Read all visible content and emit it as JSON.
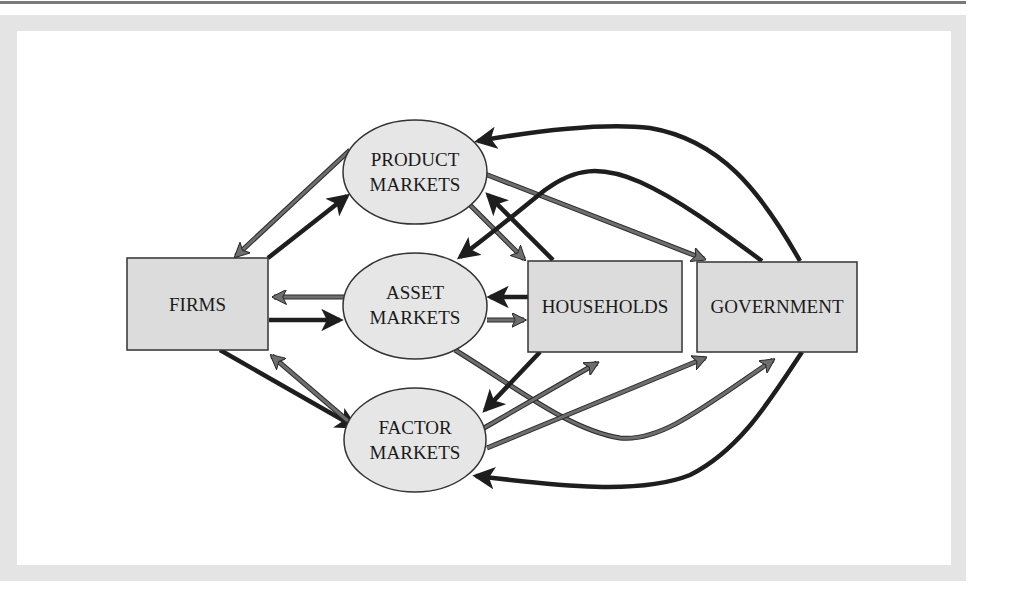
{
  "diagram": {
    "type": "circular-flow",
    "colors": {
      "box_fill": "#dcdcdc",
      "ellipse_fill": "#e6e6e6",
      "outline": "#333333",
      "dark_arrow": "#1e1e1e",
      "grey_arrow": "#6e6e6e",
      "frame": "#e4e4e4"
    },
    "nodes": {
      "firms": {
        "label": "FIRMS",
        "shape": "rectangle"
      },
      "households": {
        "label": "HOUSEHOLDS",
        "shape": "rectangle"
      },
      "government": {
        "label": "GOVERNMENT",
        "shape": "rectangle"
      },
      "product_markets": {
        "line1": "PRODUCT",
        "line2": "MARKETS",
        "shape": "ellipse"
      },
      "asset_markets": {
        "line1": "ASSET",
        "line2": "MARKETS",
        "shape": "ellipse"
      },
      "factor_markets": {
        "line1": "FACTOR",
        "line2": "MARKETS",
        "shape": "ellipse"
      }
    },
    "edges": [
      {
        "from": "product_markets",
        "to": "firms",
        "style": "grey"
      },
      {
        "from": "firms",
        "to": "product_markets",
        "style": "dark"
      },
      {
        "from": "asset_markets",
        "to": "firms",
        "style": "grey"
      },
      {
        "from": "firms",
        "to": "asset_markets",
        "style": "dark"
      },
      {
        "from": "firms",
        "to": "factor_markets",
        "style": "dark"
      },
      {
        "from": "factor_markets",
        "to": "firms",
        "style": "grey"
      },
      {
        "from": "product_markets",
        "to": "households",
        "style": "grey"
      },
      {
        "from": "households",
        "to": "product_markets",
        "style": "dark"
      },
      {
        "from": "product_markets",
        "to": "government",
        "style": "grey"
      },
      {
        "from": "government",
        "to": "product_markets",
        "style": "dark"
      },
      {
        "from": "government",
        "to": "asset_markets",
        "style": "dark"
      },
      {
        "from": "households",
        "to": "asset_markets",
        "style": "dark"
      },
      {
        "from": "asset_markets",
        "to": "households",
        "style": "grey"
      },
      {
        "from": "asset_markets",
        "to": "government",
        "style": "grey"
      },
      {
        "from": "households",
        "to": "factor_markets",
        "style": "dark"
      },
      {
        "from": "factor_markets",
        "to": "households",
        "style": "grey"
      },
      {
        "from": "factor_markets",
        "to": "government",
        "style": "grey"
      },
      {
        "from": "government",
        "to": "factor_markets",
        "style": "dark"
      }
    ]
  }
}
